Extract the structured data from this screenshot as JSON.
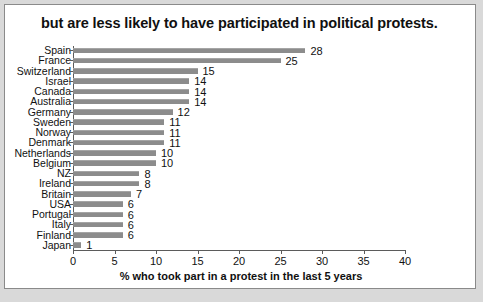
{
  "chart_data": {
    "type": "bar",
    "orientation": "horizontal",
    "title": "but are less likely to have participated in political protests.",
    "xlabel": "% who took part in a protest in the last 5 years",
    "ylabel": "",
    "xlim": [
      0,
      40
    ],
    "xticks": [
      0,
      5,
      10,
      15,
      20,
      25,
      30,
      35,
      40
    ],
    "grid": false,
    "legend": null,
    "bar_color": "#8c8c8c",
    "categories": [
      "Spain",
      "France",
      "Switzerland",
      "Israel",
      "Canada",
      "Australia",
      "Germany",
      "Sweden",
      "Norway",
      "Denmark",
      "Netherlands",
      "Belgium",
      "NZ",
      "Ireland",
      "Britain",
      "USA",
      "Portugal",
      "Italy",
      "Finland",
      "Japan"
    ],
    "values": [
      28,
      25,
      15,
      14,
      14,
      14,
      12,
      11,
      11,
      11,
      10,
      10,
      8,
      8,
      7,
      6,
      6,
      6,
      6,
      1
    ],
    "data_labels": [
      "28",
      "25",
      "15",
      "14",
      "14",
      "14",
      "12",
      "11",
      "11",
      "11",
      "10",
      "10",
      "8",
      "8",
      "7",
      "6",
      "6",
      "6",
      "6",
      "1"
    ]
  }
}
